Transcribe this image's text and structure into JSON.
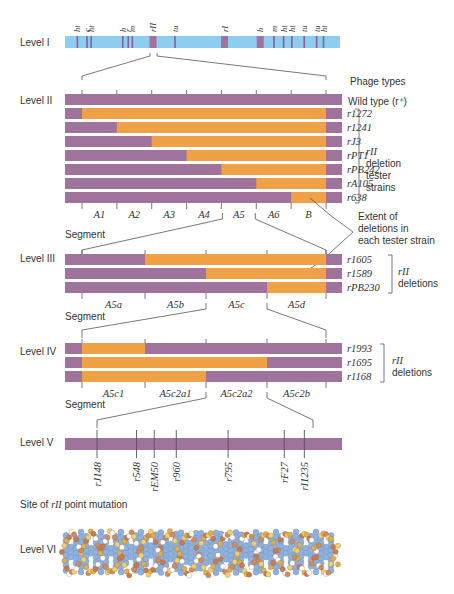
{
  "colors": {
    "chromosome": "#8ecdf0",
    "purple": "#a0739c",
    "orange": "#f0a045",
    "line": "#555555"
  },
  "level1": {
    "label": "Level I",
    "markers": [
      {
        "label": "ht",
        "pos": 0.045
      },
      {
        "label": "c",
        "pos": 0.08
      },
      {
        "label": "ht",
        "pos": 0.095
      },
      {
        "label": "h",
        "pos": 0.21
      },
      {
        "label": "r",
        "pos": 0.23
      },
      {
        "label": "m",
        "pos": 0.245
      },
      {
        "label": "rII",
        "pos": 0.32,
        "region": true
      },
      {
        "label": "tu",
        "pos": 0.4
      },
      {
        "label": "rI",
        "pos": 0.58,
        "region": true
      },
      {
        "label": "h",
        "pos": 0.71,
        "region": true
      },
      {
        "label": "m",
        "pos": 0.76
      },
      {
        "label": "ht",
        "pos": 0.795
      },
      {
        "label": "ht",
        "pos": 0.825
      },
      {
        "label": "tu",
        "pos": 0.87
      },
      {
        "label": "tu",
        "pos": 0.915
      },
      {
        "label": "ht",
        "pos": 0.94
      }
    ]
  },
  "level2": {
    "label": "Level II",
    "header": "Phage types",
    "wild_type": "Wild type (r⁺)",
    "segments": [
      "A1",
      "A2",
      "A3",
      "A4",
      "A5",
      "A6",
      "B"
    ],
    "segment_label": "Segment",
    "strains": [
      {
        "name": "r1272",
        "start_segment": 0
      },
      {
        "name": "r1241",
        "start_segment": 1
      },
      {
        "name": "rJ3",
        "start_segment": 2
      },
      {
        "name": "rPT1",
        "start_segment": 3
      },
      {
        "name": "rPB242",
        "start_segment": 4
      },
      {
        "name": "rA105",
        "start_segment": 5
      },
      {
        "name": "r638",
        "start_segment": 6
      }
    ],
    "bracket_label": [
      "rII",
      "deletion",
      "tester",
      "strains"
    ],
    "annotation": [
      "Extent of",
      "deletions in",
      "each tester strain"
    ]
  },
  "level3": {
    "label": "Level III",
    "segments": [
      "A5a",
      "A5b",
      "A5c",
      "A5d"
    ],
    "segment_label": "Segment",
    "strains": [
      {
        "name": "r1605",
        "start_segment": 1
      },
      {
        "name": "r1589",
        "start_segment": 2
      },
      {
        "name": "rPB230",
        "start_segment": 3
      }
    ],
    "bracket_label": [
      "rII",
      "deletions"
    ]
  },
  "level4": {
    "label": "Level IV",
    "segments": [
      "A5c1",
      "A5c2a1",
      "A5c2a2",
      "A5c2b"
    ],
    "segment_label": "Segment",
    "strains": [
      {
        "name": "r1993",
        "del_from": 0,
        "del_to": 1
      },
      {
        "name": "r1695",
        "del_from": 0,
        "del_to": 3
      },
      {
        "name": "r1168",
        "del_from": 0,
        "del_to": 2
      }
    ],
    "bracket_label": [
      "rII",
      "deletions"
    ]
  },
  "level5": {
    "label": "Level V",
    "mutations": [
      {
        "name": "rJ148",
        "pos": 0.0
      },
      {
        "name": "r548",
        "pos": 0.183
      },
      {
        "name": "rEM50",
        "pos": 0.265
      },
      {
        "name": "r960",
        "pos": 0.367
      },
      {
        "name": "r795",
        "pos": 0.607
      },
      {
        "name": "rF27",
        "pos": 0.867
      },
      {
        "name": "rI1235",
        "pos": 0.96
      }
    ],
    "site_label_prefix": "Site of ",
    "site_label_italic": "rII",
    "site_label_suffix": " point mutation"
  },
  "level6": {
    "label": "Level VI"
  }
}
